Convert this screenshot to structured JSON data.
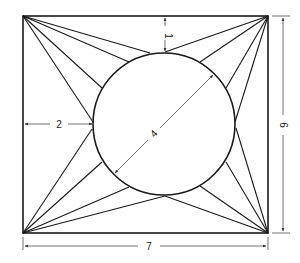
{
  "diagram": {
    "title": "",
    "shape": "rectangle with inscribed circle and corner fans",
    "colors": {
      "stroke": "#1a1a1a",
      "background": "#ffffff",
      "dimension": "#333333"
    },
    "rectangle": {
      "width_units": 7,
      "height_units": 6
    },
    "circle": {
      "diameter_units": 4,
      "offset_left_units": 2,
      "offset_top_units": 1
    },
    "dimensions": {
      "width_label": "7",
      "height_label": "6",
      "diameter_label": "4",
      "left_offset_label": "2",
      "top_offset_label": "1"
    },
    "fan_lines_per_corner": 4
  }
}
